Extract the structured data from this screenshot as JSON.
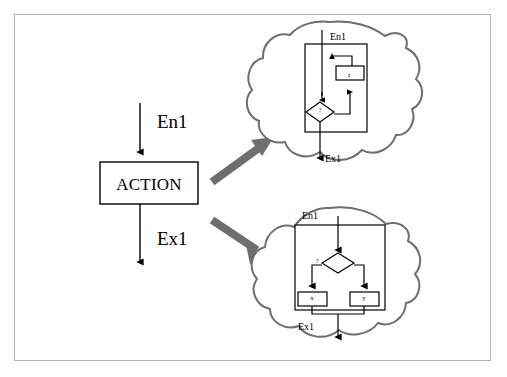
{
  "figure": {
    "background_color": "#ffffff",
    "frame_color": "#b4b4b4",
    "line_color": "#000000",
    "expansion_arrow_color": "#6e6e6e"
  },
  "main_flow": {
    "entry_label": "En1",
    "action_label": "ACTION",
    "exit_label": "Ex1"
  },
  "expansion_arrows": [
    {
      "name": "arrow-to-loop-detail",
      "direction": "up-right"
    },
    {
      "name": "arrow-to-branch-detail",
      "direction": "down-right"
    }
  ],
  "bubbles": [
    {
      "id": "loop-bubble",
      "entry_label": "En1",
      "exit_label": "Ex1",
      "decision_label": "?",
      "nodes": [
        {
          "id": "loop-body",
          "label": "z",
          "shape": "rectangle"
        }
      ],
      "structure": "loop"
    },
    {
      "id": "branch-bubble",
      "entry_label": "En1",
      "exit_label": "Ex1",
      "decision_label": "?",
      "nodes": [
        {
          "id": "branch-left",
          "label": "x",
          "shape": "rectangle"
        },
        {
          "id": "branch-right",
          "label": "y",
          "shape": "rectangle"
        }
      ],
      "structure": "branch"
    }
  ]
}
